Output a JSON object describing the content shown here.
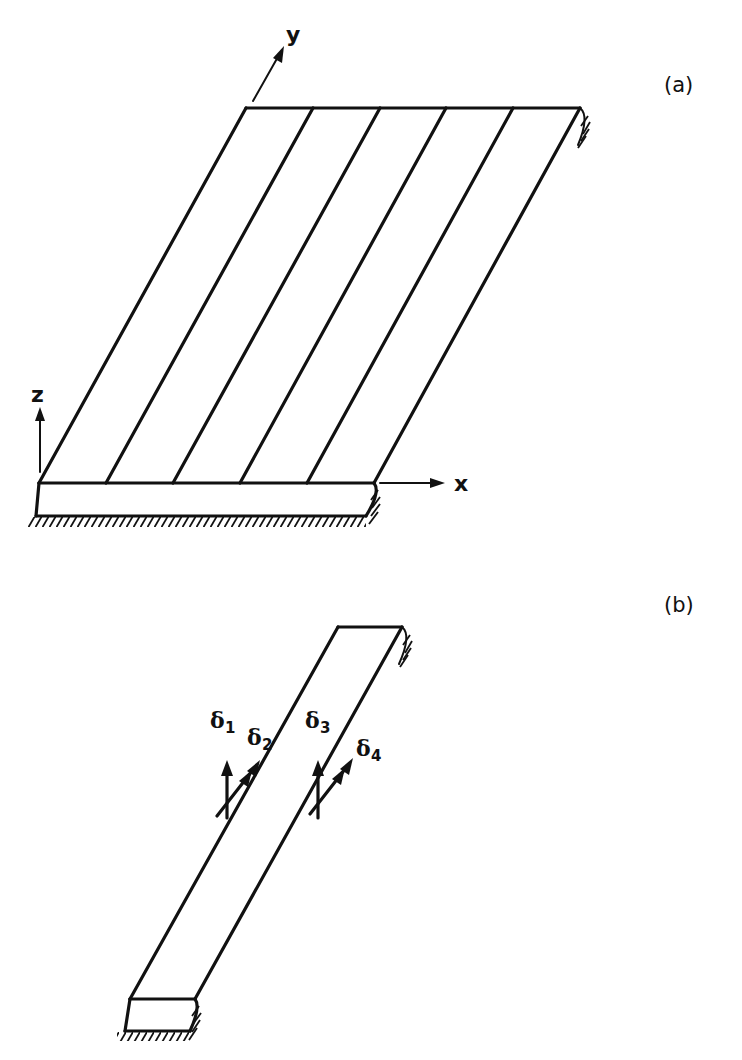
{
  "figure": {
    "panel_a": {
      "label": "(a)",
      "description": "Plate divided into strips, simply supported on two opposite edges",
      "strip_count": 5,
      "axes": {
        "x": "x",
        "y": "y",
        "z": "z"
      }
    },
    "panel_b": {
      "label": "(b)",
      "description": "Single strip element with nodal displacements",
      "dofs": [
        {
          "symbol": "δ",
          "subscript": "1"
        },
        {
          "symbol": "δ",
          "subscript": "2"
        },
        {
          "symbol": "δ",
          "subscript": "3"
        },
        {
          "symbol": "δ",
          "subscript": "4"
        }
      ]
    }
  }
}
